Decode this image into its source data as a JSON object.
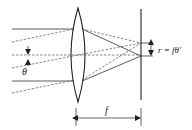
{
  "diagram": {
    "type": "optics-lens-focal-plane",
    "labels": {
      "angle": "θ",
      "radius_formula": "r = fθ′",
      "focal_length": "f"
    },
    "colors": {
      "stroke": "#222222",
      "dashed": "#555555",
      "background": "#ffffff"
    }
  }
}
